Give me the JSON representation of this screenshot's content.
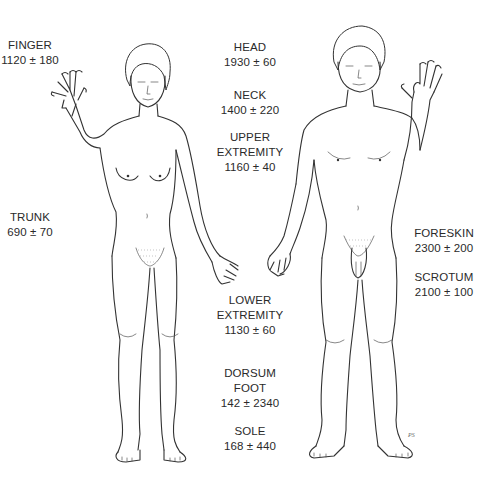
{
  "figure": {
    "type": "anatomical illustration",
    "subjects": [
      "female-figure",
      "male-figure"
    ],
    "signature": "PS"
  },
  "labels": [
    {
      "id": "finger",
      "name": "FINGER",
      "value": "1120 ± 180",
      "x": 30,
      "y": 38
    },
    {
      "id": "head",
      "name": "HEAD",
      "value": "1930 ± 60",
      "x": 250,
      "y": 40
    },
    {
      "id": "neck",
      "name": "NECK",
      "value": "1400 ± 220",
      "x": 250,
      "y": 88
    },
    {
      "id": "upper-extremity",
      "name": "UPPER EXTREMITY",
      "name_lines": [
        "UPPER",
        "EXTREMITY"
      ],
      "value": "1160 ± 40",
      "x": 250,
      "y": 130
    },
    {
      "id": "trunk",
      "name": "TRUNK",
      "value": "690 ± 70",
      "x": 30,
      "y": 210
    },
    {
      "id": "foreskin",
      "name": "FORESKIN",
      "value": "2300 ± 200",
      "x": 444,
      "y": 226
    },
    {
      "id": "scrotum",
      "name": "SCROTUM",
      "value": "2100 ± 100",
      "x": 444,
      "y": 270
    },
    {
      "id": "lower-extremity",
      "name": "LOWER EXTREMITY",
      "name_lines": [
        "LOWER",
        "EXTREMITY"
      ],
      "value": "1130 ± 60",
      "x": 250,
      "y": 293
    },
    {
      "id": "dorsum-foot",
      "name": "DORSUM FOOT",
      "name_lines": [
        "DORSUM",
        "FOOT"
      ],
      "value": "142 ± 2340",
      "x": 250,
      "y": 366
    },
    {
      "id": "sole",
      "name": "SOLE",
      "value": "168 ± 440",
      "x": 250,
      "y": 424
    }
  ]
}
